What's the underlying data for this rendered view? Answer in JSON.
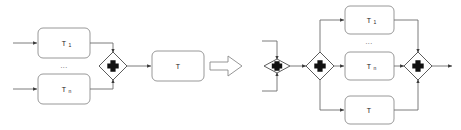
{
  "figure": {
    "type": "bpmn-transformation-rule",
    "background_color": "#ffffff",
    "line_color": "#6e6e6e",
    "box_stroke_color": "#8d8d8d",
    "gateway_stroke_color": "#4a4a4a",
    "gateway_marker_color": "#111111",
    "text_color": "#1a1a1a"
  },
  "left_pattern": {
    "name": "left-hand-side-pattern",
    "tasks": [
      {
        "id": "task-t1",
        "base": "T",
        "subscript": "1",
        "label": "T1"
      },
      {
        "id": "task-tn",
        "base": "T",
        "subscript": "n",
        "label": "Tn"
      },
      {
        "id": "task-t",
        "base": "T",
        "subscript": "",
        "label": "T"
      }
    ],
    "ellipsis": "...",
    "gateways": [
      {
        "id": "gateway-join",
        "kind": "parallel",
        "marker": "plus"
      }
    ],
    "inputs": 2,
    "outputs": 1
  },
  "implies_symbol": {
    "name": "implies-arrow",
    "glyph": "=>",
    "meaning": "transforms to"
  },
  "right_pattern": {
    "name": "right-hand-side-pattern",
    "tasks": [
      {
        "id": "task-t1",
        "base": "T",
        "subscript": "1",
        "label": "T1"
      },
      {
        "id": "task-tn",
        "base": "T",
        "subscript": "n",
        "label": "Tn"
      },
      {
        "id": "task-t",
        "base": "T",
        "subscript": "",
        "label": "T"
      }
    ],
    "ellipsis": "...",
    "gateways": [
      {
        "id": "gateway-join",
        "kind": "parallel",
        "marker": "plus"
      },
      {
        "id": "gateway-split",
        "kind": "parallel",
        "marker": "plus"
      },
      {
        "id": "gateway-merge",
        "kind": "parallel",
        "marker": "plus"
      }
    ],
    "inputs": 2,
    "outputs": 1
  }
}
